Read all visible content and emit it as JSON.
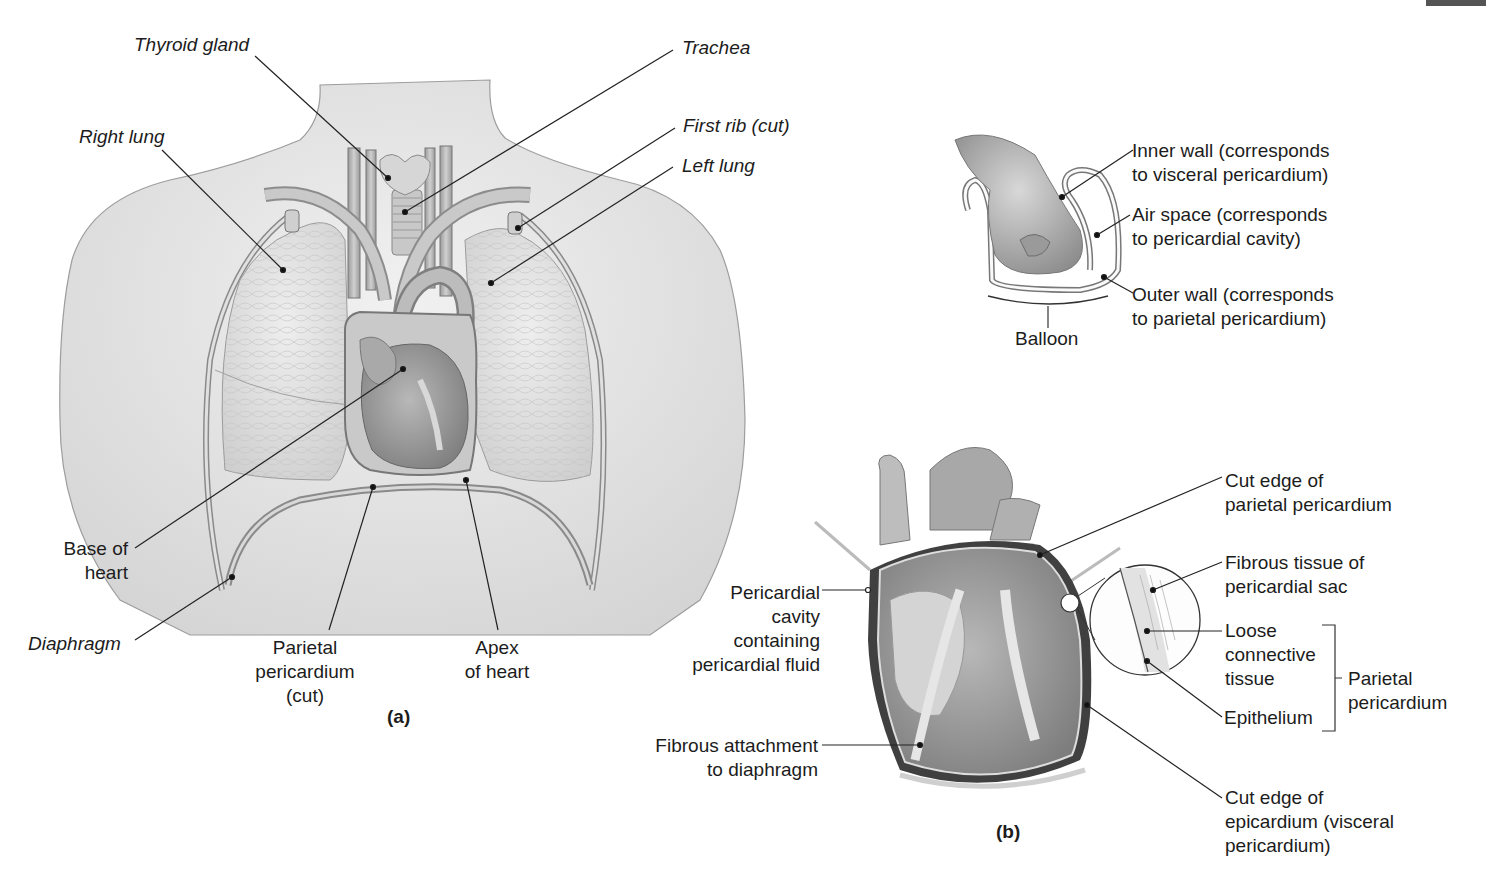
{
  "figure": {
    "panel_a": {
      "tag": "(a)",
      "labels": {
        "thyroid_gland": "Thyroid gland",
        "trachea": "Trachea",
        "right_lung": "Right lung",
        "first_rib": "First rib (cut)",
        "left_lung": "Left lung",
        "base_of_heart": [
          "Base of",
          "heart"
        ],
        "diaphragm": "Diaphragm",
        "parietal_pericardium_cut": [
          "Parietal",
          "pericardium",
          "(cut)"
        ],
        "apex_of_heart": [
          "Apex",
          "of heart"
        ]
      }
    },
    "balloon_inset": {
      "labels": {
        "inner_wall": [
          "Inner wall (corresponds",
          "to visceral pericardium)"
        ],
        "air_space": [
          "Air space (corresponds",
          "to pericardial cavity)"
        ],
        "outer_wall": [
          "Outer wall (corresponds",
          "to parietal pericardium)"
        ],
        "balloon": "Balloon"
      }
    },
    "panel_b": {
      "tag": "(b)",
      "labels": {
        "cut_edge_parietal": [
          "Cut edge of",
          "parietal pericardium"
        ],
        "fibrous_tissue": [
          "Fibrous tissue of",
          "pericardial sac"
        ],
        "loose_connective": [
          "Loose",
          "connective",
          "tissue"
        ],
        "epithelium": "Epithelium",
        "parietal_pericardium_group": [
          "Parietal",
          "pericardium"
        ],
        "pericardial_cavity": [
          "Pericardial",
          "cavity",
          "containing",
          "pericardial fluid"
        ],
        "fibrous_attachment": [
          "Fibrous attachment",
          "to diaphragm"
        ],
        "cut_edge_epicardium": [
          "Cut edge of",
          "epicardium (visceral",
          "pericardium)"
        ]
      }
    },
    "colors": {
      "skin": "#e6e6e6",
      "lung": "#d9d9d9",
      "heart": "#9a9a9a",
      "vessel": "#b5b5b5",
      "line": "#222222",
      "cavity": "#444444"
    }
  }
}
